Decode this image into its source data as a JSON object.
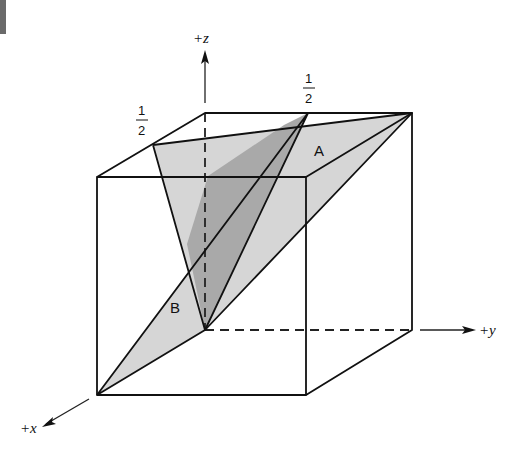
{
  "figure": {
    "axes": {
      "x_label": "+x",
      "y_label": "+y",
      "z_label": "+z"
    },
    "planes": [
      {
        "name": "A",
        "label": "A",
        "fill": "#d6d6d6"
      },
      {
        "name": "B",
        "label": "B",
        "fill": "#d6d6d6"
      }
    ],
    "overlap_fill": "#a9a9a9",
    "intercepts": [
      {
        "position": "x-edge-top",
        "numerator": "1",
        "denominator": "2"
      },
      {
        "position": "y-edge-top",
        "numerator": "1",
        "denominator": "2"
      }
    ],
    "colors": {
      "line": "#111111",
      "plane": "#d6d6d6",
      "overlap": "#a9a9a9",
      "background": "#ffffff"
    }
  }
}
